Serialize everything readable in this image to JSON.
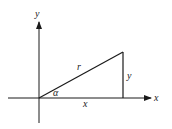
{
  "diagram": {
    "type": "right-triangle-polar-coordinates",
    "axes": {
      "x_label": "x",
      "y_label": "y"
    },
    "labels": {
      "hypotenuse": "r",
      "opposite_side": "y",
      "adjacent_side": "x",
      "angle": "α"
    },
    "colors": {
      "stroke": "#1a1a1a",
      "text": "#222222",
      "background": "#ffffff"
    }
  }
}
